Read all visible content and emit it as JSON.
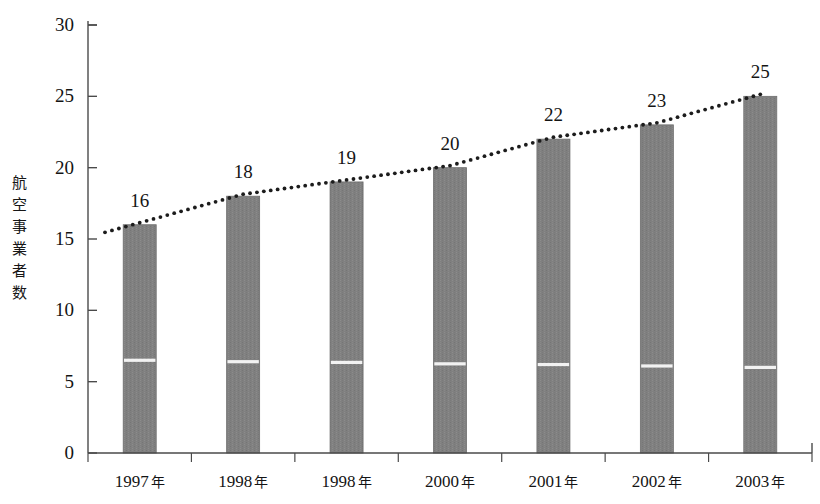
{
  "chart_data": {
    "type": "bar",
    "title": "",
    "subtitle": "",
    "xlabel": "",
    "ylabel": "航空事業者数",
    "ylabel_chars": "航\n空\n事\n業\n者\n数",
    "categories": [
      "1997 年",
      "1998 年",
      "1998 年",
      "2000 年",
      "2001 年",
      "2002 年",
      "2003 年"
    ],
    "category_years": [
      "1997",
      "1998",
      "1998",
      "2000",
      "2001",
      "2002",
      "2003"
    ],
    "category_unit": "年",
    "values": [
      16,
      18,
      19,
      20,
      22,
      23,
      25
    ],
    "value_labels": [
      "16",
      "18",
      "19",
      "20",
      "22",
      "23",
      "25"
    ],
    "ylim": [
      0,
      30
    ],
    "ytick_values": [
      0,
      5,
      10,
      15,
      20,
      25,
      30
    ],
    "ytick_labels": [
      "0",
      "5",
      "10",
      "15",
      "20",
      "25",
      "30"
    ],
    "grid": false,
    "legend": false,
    "legend_position": "none",
    "series": [
      {
        "name": "航空事業者数",
        "type": "bar",
        "values": [
          16,
          18,
          19,
          20,
          22,
          23,
          25
        ]
      },
      {
        "name": "trend-line",
        "type": "line",
        "style": "dotted",
        "values": [
          16,
          18,
          19,
          20,
          22,
          23,
          25
        ]
      }
    ],
    "bar_inner_divider": {
      "description": "white horizontal rule crossing each bar",
      "values": [
        6.5,
        6.4,
        6.35,
        6.25,
        6.2,
        6.1,
        6.0
      ]
    }
  },
  "colors": {
    "bar_fill": "#808080",
    "bar_edge": "#6e6e6e",
    "axis": "#4a4a4a",
    "text": "#141414",
    "trend_dot": "#1c1c1c",
    "divider": "#f2f2f2",
    "background": "#ffffff"
  }
}
